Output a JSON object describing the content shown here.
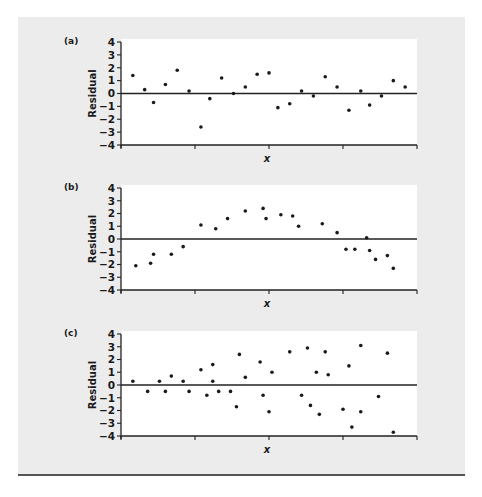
{
  "figure": {
    "background": "#ececec",
    "plot_background": "#ffffff",
    "point_color": "#1a1a1a",
    "axis_color": "#222222",
    "rule_color": "#555555"
  },
  "chart_data": [
    {
      "type": "scatter",
      "panel_label": "(a)",
      "title": "",
      "xlabel": "x",
      "ylabel": "Residual",
      "ylim": [
        -4,
        4
      ],
      "yticks": [
        4,
        3,
        2,
        1,
        0,
        -1,
        -2,
        -3,
        -4
      ],
      "xticks_count": 5,
      "reference_line_y": 0,
      "grid": false,
      "x": [
        0.04,
        0.08,
        0.11,
        0.15,
        0.19,
        0.23,
        0.27,
        0.3,
        0.34,
        0.38,
        0.42,
        0.46,
        0.5,
        0.53,
        0.57,
        0.61,
        0.65,
        0.69,
        0.73,
        0.77,
        0.81,
        0.84,
        0.88,
        0.92,
        0.96
      ],
      "y": [
        1.4,
        0.3,
        -0.7,
        0.7,
        1.8,
        0.2,
        -2.6,
        -0.4,
        1.2,
        0.0,
        0.5,
        1.5,
        1.6,
        -1.1,
        -0.8,
        0.2,
        -0.2,
        1.3,
        0.5,
        -1.3,
        0.2,
        -0.9,
        -0.2,
        1.0,
        0.5
      ]
    },
    {
      "type": "scatter",
      "panel_label": "(b)",
      "title": "",
      "xlabel": "x",
      "ylabel": "Residual",
      "ylim": [
        -4,
        4
      ],
      "yticks": [
        4,
        3,
        2,
        1,
        0,
        -1,
        -2,
        -3,
        -4
      ],
      "xticks_count": 5,
      "reference_line_y": 0,
      "grid": false,
      "x": [
        0.05,
        0.1,
        0.11,
        0.17,
        0.21,
        0.27,
        0.32,
        0.36,
        0.42,
        0.48,
        0.49,
        0.54,
        0.58,
        0.6,
        0.68,
        0.73,
        0.76,
        0.79,
        0.83,
        0.84,
        0.86,
        0.9,
        0.92
      ],
      "y": [
        -2.1,
        -1.9,
        -1.2,
        -1.2,
        -0.6,
        1.1,
        0.8,
        1.6,
        2.2,
        2.4,
        1.6,
        1.9,
        1.8,
        1.0,
        1.2,
        0.5,
        -0.8,
        -0.8,
        0.1,
        -0.9,
        -1.6,
        -1.3,
        -2.3
      ]
    },
    {
      "type": "scatter",
      "panel_label": "(c)",
      "title": "",
      "xlabel": "x",
      "ylabel": "Residual",
      "ylim": [
        -4,
        4
      ],
      "yticks": [
        4,
        3,
        2,
        1,
        0,
        -1,
        -2,
        -3,
        -4
      ],
      "xticks_count": 5,
      "reference_line_y": 0,
      "grid": false,
      "x": [
        0.04,
        0.09,
        0.13,
        0.15,
        0.17,
        0.21,
        0.23,
        0.27,
        0.29,
        0.31,
        0.31,
        0.33,
        0.37,
        0.39,
        0.4,
        0.42,
        0.47,
        0.48,
        0.5,
        0.51,
        0.57,
        0.61,
        0.63,
        0.64,
        0.66,
        0.67,
        0.69,
        0.7,
        0.75,
        0.77,
        0.78,
        0.81,
        0.81,
        0.87,
        0.9,
        0.92
      ],
      "y": [
        0.3,
        -0.5,
        0.3,
        -0.5,
        0.7,
        0.3,
        -0.5,
        1.2,
        -0.8,
        1.6,
        0.3,
        -0.5,
        -0.5,
        -1.7,
        2.4,
        0.6,
        1.8,
        -0.8,
        -2.1,
        1.0,
        2.6,
        -0.8,
        2.9,
        -1.6,
        1.0,
        -2.3,
        2.6,
        0.8,
        -1.9,
        1.5,
        -3.3,
        3.1,
        -2.1,
        -0.9,
        2.5,
        -3.7
      ]
    }
  ]
}
